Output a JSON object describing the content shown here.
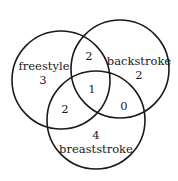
{
  "diagram": {
    "type": "venn",
    "sets": [
      {
        "name": "freestyle",
        "only_count": "3",
        "cx": 61,
        "cy": 80,
        "r": 49
      },
      {
        "name": "backstroke",
        "only_count": "2",
        "cx": 120,
        "cy": 69,
        "r": 49
      },
      {
        "name": "breaststroke",
        "only_count": "4",
        "cx": 96,
        "cy": 120,
        "r": 49
      }
    ],
    "regions": {
      "freestyle_only": "3",
      "backstroke_only": "2",
      "breaststroke_only": "4",
      "freestyle_backstroke": "2",
      "freestyle_breaststroke": "2",
      "backstroke_breaststroke": "0",
      "all_three": "1"
    },
    "stroke_color": "#1a1a1a",
    "background": "#ffffff"
  }
}
